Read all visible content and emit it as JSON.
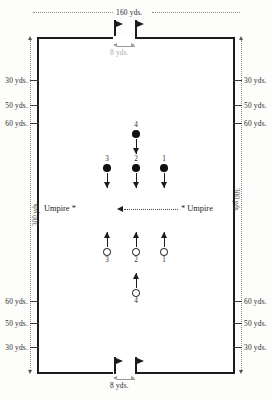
{
  "diagram": {
    "top_width_label": "160 yds.",
    "top_goal_label": "8 yds.",
    "bottom_goal_label": "8 yds.",
    "side_length_label": "300 yds."
  },
  "left_marks": [
    {
      "label": "30 yds."
    },
    {
      "label": "50 yds."
    },
    {
      "label": "60 yds."
    },
    {
      "label": "60 yds."
    },
    {
      "label": "50 yds."
    },
    {
      "label": "30 yds."
    }
  ],
  "right_marks": [
    {
      "label": "30 yds."
    },
    {
      "label": "50 yds."
    },
    {
      "label": "60 yds."
    },
    {
      "label": "60 yds."
    },
    {
      "label": "50 yds."
    },
    {
      "label": "30 yds."
    }
  ],
  "umpires": {
    "left_label": "Umpire *",
    "right_label": "* Umpire"
  },
  "team_top": {
    "marker": "filled-circle",
    "direction": "down",
    "players": [
      {
        "number": "4",
        "row": "front"
      },
      {
        "number": "3",
        "row": "back"
      },
      {
        "number": "2",
        "row": "back"
      },
      {
        "number": "1",
        "row": "back"
      }
    ]
  },
  "team_bottom": {
    "marker": "hollow-circle",
    "direction": "up",
    "players": [
      {
        "number": "3",
        "row": "back"
      },
      {
        "number": "2",
        "row": "back"
      },
      {
        "number": "1",
        "row": "back"
      },
      {
        "number": "4",
        "row": "front"
      }
    ]
  },
  "flags": {
    "count": 4,
    "icon": "flag-icon"
  }
}
